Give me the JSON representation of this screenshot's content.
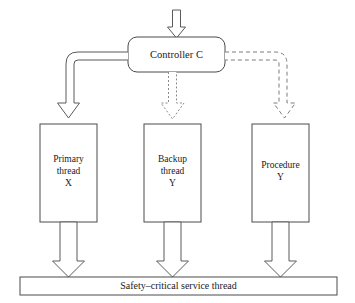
{
  "diagram": {
    "background_color": "#ffffff",
    "line_color": "#4a4a4a",
    "text_color": "#1a1a1a",
    "controller": {
      "label": "Controller C",
      "shape": "rounded-rectangle"
    },
    "nodes": [
      {
        "id": "primary-thread",
        "line1": "Primary",
        "line2": "thread",
        "line3": "X",
        "shape": "rectangle"
      },
      {
        "id": "backup-thread",
        "line1": "Backup",
        "line2": "thread",
        "line3": "Y",
        "shape": "rectangle"
      },
      {
        "id": "procedure",
        "line1": "Procedure",
        "line2": "Y",
        "line3": "",
        "shape": "rectangle"
      }
    ],
    "service_bar": {
      "label": "Safety–critical service thread",
      "shape": "rectangle"
    },
    "connectors": [
      {
        "id": "input-arrow",
        "style": "solid",
        "from": "external-input",
        "to": "controller",
        "arrow_type": "hollow-block"
      },
      {
        "id": "controller-to-primary",
        "style": "solid",
        "from": "controller",
        "to": "primary-thread",
        "arrow_type": "hollow-block"
      },
      {
        "id": "controller-to-backup",
        "style": "dotted",
        "from": "controller",
        "to": "backup-thread",
        "arrow_type": "hollow-block"
      },
      {
        "id": "controller-to-procedure",
        "style": "dashed",
        "from": "controller",
        "to": "procedure",
        "arrow_type": "hollow-block"
      },
      {
        "id": "primary-to-service",
        "style": "solid",
        "from": "primary-thread",
        "to": "service-bar",
        "arrow_type": "hollow-block"
      },
      {
        "id": "backup-to-service",
        "style": "solid",
        "from": "backup-thread",
        "to": "service-bar",
        "arrow_type": "hollow-block"
      },
      {
        "id": "procedure-to-service",
        "style": "solid",
        "from": "procedure",
        "to": "service-bar",
        "arrow_type": "hollow-block"
      }
    ]
  }
}
